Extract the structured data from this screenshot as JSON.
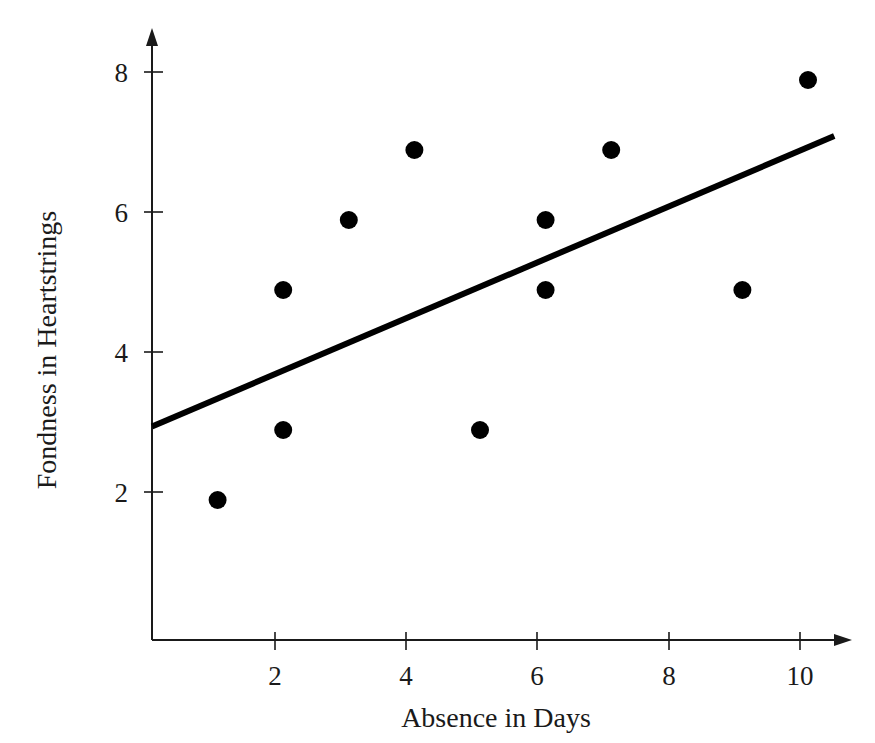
{
  "chart_data": {
    "type": "scatter",
    "title": "",
    "xlabel": "Absence in Days",
    "ylabel": "Fondness in Heartstrings",
    "xlim": [
      0,
      10.8
    ],
    "ylim": [
      0,
      8.8
    ],
    "xticks": [
      2,
      4,
      6,
      8,
      10
    ],
    "yticks": [
      2,
      4,
      6,
      8
    ],
    "xtick_labels": [
      "2",
      "4",
      "6",
      "8",
      "10"
    ],
    "ytick_labels": [
      "2",
      "4",
      "6",
      "8"
    ],
    "grid": false,
    "legend": false,
    "points": [
      {
        "x": 1,
        "y": 2
      },
      {
        "x": 2,
        "y": 5
      },
      {
        "x": 2,
        "y": 3
      },
      {
        "x": 3,
        "y": 6
      },
      {
        "x": 4,
        "y": 7
      },
      {
        "x": 5,
        "y": 3
      },
      {
        "x": 6,
        "y": 6
      },
      {
        "x": 6,
        "y": 5
      },
      {
        "x": 7,
        "y": 7
      },
      {
        "x": 9,
        "y": 5
      },
      {
        "x": 10,
        "y": 8
      }
    ],
    "point_color": "#000000",
    "point_size": 9,
    "trend_line": {
      "name": "line of best fit",
      "color": "#000000",
      "x_start": 0,
      "y_start": 3.05,
      "x_end": 10.4,
      "y_end": 7.2
    },
    "axis_color": "#1a1a1a",
    "background_color": "#ffffff"
  }
}
